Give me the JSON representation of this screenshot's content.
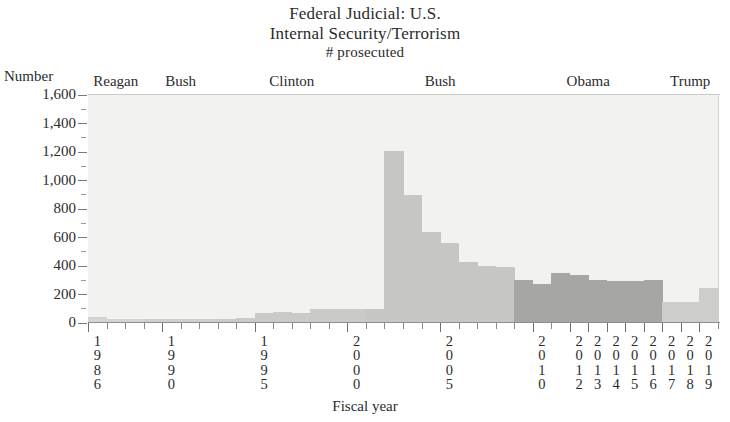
{
  "title": {
    "line1": "Federal Judicial: U.S.",
    "line2": "Internal Security/Terrorism",
    "line3": "# prosecuted"
  },
  "axes": {
    "y_name": "Number",
    "x_name": "Fiscal year"
  },
  "president_bands": [
    {
      "label": "Reagan",
      "color": "#d9d9d6"
    },
    {
      "label": "Bush",
      "color": "#d0d0cd"
    },
    {
      "label": "Clinton",
      "color": "#d9d9d6"
    },
    {
      "label": "Bush",
      "color": "#c7c7c4"
    },
    {
      "label": "Obama",
      "color": "#a9a9a6"
    },
    {
      "label": "Trump",
      "color": "#cfcfcc"
    }
  ],
  "chart_data": {
    "type": "bar",
    "title": "Federal Judicial: U.S. Internal Security/Terrorism # prosecuted",
    "xlabel": "Fiscal year",
    "ylabel": "Number",
    "ylim": [
      0,
      1600
    ],
    "ytick_values": [
      0,
      200,
      400,
      600,
      800,
      1000,
      1200,
      1400,
      1600
    ],
    "ytick_labels": [
      "0",
      "200",
      "400",
      "600",
      "800",
      "1,000",
      "1,200",
      "1,400",
      "1,600"
    ],
    "grid": false,
    "legend": "none",
    "xtick_labeled_years": [
      1986,
      1990,
      1995,
      2000,
      2005,
      2010,
      2012,
      2013,
      2014,
      2015,
      2016,
      2017,
      2018,
      2019
    ],
    "categories": [
      1986,
      1987,
      1988,
      1989,
      1990,
      1991,
      1992,
      1993,
      1994,
      1995,
      1996,
      1997,
      1998,
      1999,
      2000,
      2001,
      2002,
      2003,
      2004,
      2005,
      2006,
      2007,
      2008,
      2009,
      2010,
      2011,
      2012,
      2013,
      2014,
      2015,
      2016,
      2017,
      2018,
      2019
    ],
    "values": [
      40,
      30,
      28,
      26,
      26,
      26,
      26,
      30,
      34,
      70,
      75,
      72,
      95,
      98,
      96,
      100,
      1205,
      900,
      640,
      560,
      430,
      400,
      395,
      300,
      275,
      350,
      340,
      300,
      295,
      295,
      300,
      150,
      150,
      245
    ],
    "president_by_year": [
      "Reagan",
      "Reagan",
      "Reagan",
      "Bush",
      "Bush",
      "Bush",
      "Bush",
      "Clinton",
      "Clinton",
      "Clinton",
      "Clinton",
      "Clinton",
      "Clinton",
      "Clinton",
      "Clinton",
      "Bush",
      "Bush",
      "Bush",
      "Bush",
      "Bush",
      "Bush",
      "Bush",
      "Bush",
      "Obama",
      "Obama",
      "Obama",
      "Obama",
      "Obama",
      "Obama",
      "Obama",
      "Obama",
      "Trump",
      "Trump",
      "Trump"
    ],
    "series_colors": {
      "Reagan": "#d4d4d1",
      "Bush1": "#cfcfcc",
      "Clinton": "#cacac7",
      "Bush2": "#c6c6c3",
      "Obama": "#a6a6a3",
      "Trump": "#cdcdca"
    }
  }
}
